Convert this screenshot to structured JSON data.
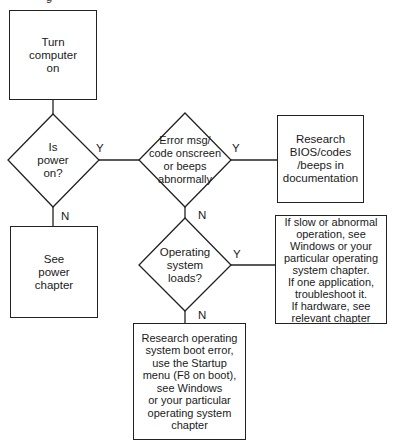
{
  "diagram": {
    "type": "flowchart",
    "cropped_top_glyph": "g",
    "nodes": {
      "start": {
        "shape": "rectangle",
        "text": "Turn\ncomputer\non"
      },
      "power_q": {
        "shape": "diamond",
        "text": "Is\npower\non?"
      },
      "error_q": {
        "shape": "diamond",
        "text": "Error msg/\ncode onscreen\nor beeps\nabnormally"
      },
      "bios": {
        "shape": "rectangle",
        "text": "Research\nBIOS/codes\n/beeps in\ndocumentation"
      },
      "power_chapter": {
        "shape": "rectangle",
        "text": "See\npower\nchapter"
      },
      "os_q": {
        "shape": "diamond",
        "text": "Operating\nsystem\nloads?"
      },
      "slow": {
        "shape": "rectangle",
        "text": "If slow or abnormal\noperation,  see\nWindows or your\nparticular operating\nsystem chapter.\nIf one application,\ntroubleshoot it.\n If hardware, see\nrelevant chapter"
      },
      "boot_error": {
        "shape": "rectangle",
        "text": "Research operating\nsystem boot error,\nuse the Startup\nmenu (F8 on boot),\nsee Windows\nor your particular\noperating system\nchapter"
      }
    },
    "edges": [
      {
        "from": "start",
        "to": "power_q",
        "label": ""
      },
      {
        "from": "power_q",
        "to": "error_q",
        "label": "Y"
      },
      {
        "from": "power_q",
        "to": "power_chapter",
        "label": "N"
      },
      {
        "from": "error_q",
        "to": "bios",
        "label": "Y"
      },
      {
        "from": "error_q",
        "to": "os_q",
        "label": "N"
      },
      {
        "from": "os_q",
        "to": "slow",
        "label": "Y"
      },
      {
        "from": "os_q",
        "to": "boot_error",
        "label": "N"
      }
    ],
    "colors": {
      "stroke": "#222222",
      "background": "#ffffff",
      "text": "#1a1a1a"
    }
  }
}
